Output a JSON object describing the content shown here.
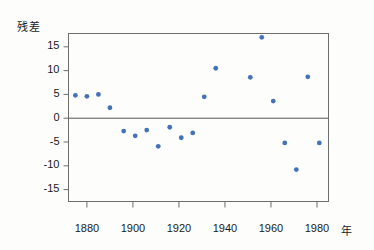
{
  "chart_data": {
    "type": "scatter",
    "title": "",
    "xlabel": "年",
    "ylabel": "残差",
    "xlim": [
      1872,
      1985
    ],
    "ylim": [
      -17.5,
      17.8
    ],
    "xticks": [
      1880,
      1900,
      1920,
      1940,
      1960,
      1980
    ],
    "yticks": [
      15,
      10,
      5,
      0,
      -5,
      -10,
      -15
    ],
    "ytick_labels": [
      "15",
      "10",
      "5",
      "0",
      "-5",
      "-10",
      "-15"
    ],
    "xtick_labels": [
      "1880",
      "1900",
      "1920",
      "1940",
      "1960",
      "1980"
    ],
    "grid": false,
    "legend": null,
    "reference_line": {
      "y": 0,
      "color": "#555555"
    },
    "marker": {
      "shape": "dot",
      "color": "#4472b8",
      "size": 2.4
    },
    "frame": {
      "color": "#6e6e6e",
      "visible": true
    },
    "x": [
      1875,
      1880,
      1885,
      1890,
      1896,
      1901,
      1906,
      1911,
      1916,
      1921,
      1926,
      1931,
      1936,
      1951,
      1956,
      1961,
      1966,
      1971,
      1976,
      1981
    ],
    "y": [
      4.8,
      4.6,
      5.0,
      2.2,
      -2.7,
      -3.7,
      -2.5,
      -5.9,
      -1.9,
      -4.1,
      -3.1,
      4.5,
      10.5,
      8.6,
      17.0,
      3.6,
      -5.2,
      -10.8,
      8.7,
      -5.2
    ],
    "series": [
      {
        "name": "残差",
        "points": [
          {
            "x": 1875,
            "y": 4.8
          },
          {
            "x": 1880,
            "y": 4.6
          },
          {
            "x": 1885,
            "y": 5.0
          },
          {
            "x": 1890,
            "y": 2.2
          },
          {
            "x": 1896,
            "y": -2.7
          },
          {
            "x": 1901,
            "y": -3.7
          },
          {
            "x": 1906,
            "y": -2.5
          },
          {
            "x": 1911,
            "y": -5.9
          },
          {
            "x": 1916,
            "y": -1.9
          },
          {
            "x": 1921,
            "y": -4.1
          },
          {
            "x": 1926,
            "y": -3.1
          },
          {
            "x": 1931,
            "y": 4.5
          },
          {
            "x": 1936,
            "y": 10.5
          },
          {
            "x": 1951,
            "y": 8.6
          },
          {
            "x": 1956,
            "y": 17.0
          },
          {
            "x": 1961,
            "y": 3.6
          },
          {
            "x": 1966,
            "y": -5.2
          },
          {
            "x": 1971,
            "y": -10.8
          },
          {
            "x": 1976,
            "y": 8.7
          },
          {
            "x": 1981,
            "y": -5.2
          }
        ]
      }
    ]
  },
  "colors": {
    "marker": "#4472b8",
    "frame": "#6e6e6e",
    "zero_line": "#555555",
    "text": "#1a1a1a",
    "background": "#fdfdfc"
  }
}
